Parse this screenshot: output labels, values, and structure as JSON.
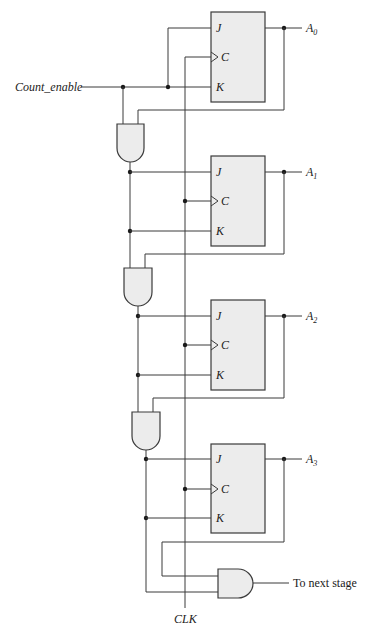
{
  "diagram": {
    "type": "4-bit synchronous binary counter (JK flip-flops)",
    "inputs": {
      "count_enable": "Count_enable",
      "clock": "CLK"
    },
    "flip_flops": [
      {
        "id": "FF0",
        "pins": {
          "j": "J",
          "c": "C",
          "k": "K"
        },
        "output": {
          "name": "A",
          "sub": "0"
        }
      },
      {
        "id": "FF1",
        "pins": {
          "j": "J",
          "c": "C",
          "k": "K"
        },
        "output": {
          "name": "A",
          "sub": "1"
        }
      },
      {
        "id": "FF2",
        "pins": {
          "j": "J",
          "c": "C",
          "k": "K"
        },
        "output": {
          "name": "A",
          "sub": "2"
        }
      },
      {
        "id": "FF3",
        "pins": {
          "j": "J",
          "c": "C",
          "k": "K"
        },
        "output": {
          "name": "A",
          "sub": "3"
        }
      }
    ],
    "gates": [
      {
        "id": "AND1",
        "type": "AND",
        "inputs": [
          "Count_enable",
          "A0"
        ]
      },
      {
        "id": "AND2",
        "type": "AND",
        "inputs": [
          "AND1",
          "A1"
        ]
      },
      {
        "id": "AND3",
        "type": "AND",
        "inputs": [
          "AND2",
          "A2"
        ]
      },
      {
        "id": "AND4",
        "type": "AND",
        "inputs": [
          "AND3",
          "A3"
        ],
        "output_label": "To next stage"
      }
    ],
    "output_label": "To next stage"
  },
  "colors": {
    "wire": "#3a3a3a",
    "fill": "#ececec",
    "junction": "#1a1a1a"
  }
}
